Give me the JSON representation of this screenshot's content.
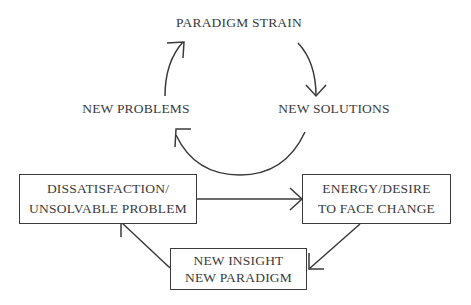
{
  "diagram": {
    "upper_cycle": {
      "nodes": [
        {
          "id": "paradigm-strain",
          "label": "PARADIGM STRAIN"
        },
        {
          "id": "new-solutions",
          "label": "NEW SOLUTIONS"
        },
        {
          "id": "new-problems",
          "label": "NEW PROBLEMS"
        }
      ],
      "edges": [
        {
          "from": "paradigm-strain",
          "to": "new-solutions"
        },
        {
          "from": "new-solutions",
          "to": "new-problems"
        },
        {
          "from": "new-problems",
          "to": "paradigm-strain"
        }
      ]
    },
    "lower_cycle": {
      "nodes": [
        {
          "id": "dissatisfaction",
          "line1": "DISSATISFACTION/",
          "line2": "UNSOLVABLE PROBLEM"
        },
        {
          "id": "energy",
          "line1": "ENERGY/DESIRE",
          "line2": "TO FACE CHANGE"
        },
        {
          "id": "insight",
          "line1": "NEW INSIGHT",
          "line2": "NEW PARADIGM"
        }
      ],
      "edges": [
        {
          "from": "dissatisfaction",
          "to": "energy"
        },
        {
          "from": "energy",
          "to": "insight"
        },
        {
          "from": "insight",
          "to": "dissatisfaction"
        }
      ]
    },
    "colors": {
      "stroke": "#3a3a3a",
      "text": "#3a3a3a",
      "background": "#ffffff"
    }
  }
}
